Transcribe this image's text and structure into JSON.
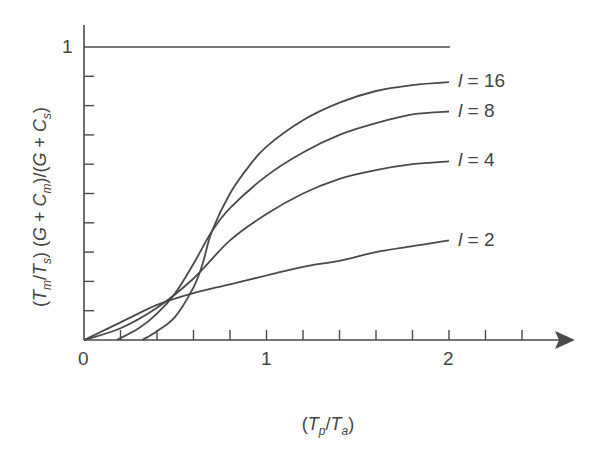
{
  "chart_data": {
    "type": "line",
    "title": "",
    "xlabel": "(Tp/Ta)",
    "ylabel": "(Tm/Ts)(G+Cm)/(G+Cs)",
    "xlim": [
      0,
      2.5
    ],
    "ylim": [
      0,
      1
    ],
    "x_ticks": [
      0,
      0.2,
      0.4,
      0.6,
      0.8,
      1.0,
      1.2,
      1.4,
      1.6,
      1.8,
      2.0,
      2.2,
      2.4
    ],
    "x_tick_labels": [
      "0",
      "1",
      "2"
    ],
    "y_ticks": [
      0.1,
      0.2,
      0.3,
      0.4,
      0.5,
      0.6,
      0.7,
      0.8,
      0.9,
      1.0
    ],
    "y_tick_labels": [
      "1"
    ],
    "grid": false,
    "reference_line": {
      "y": 1,
      "x_range": [
        0,
        2
      ]
    },
    "series": [
      {
        "name": "l = 2",
        "x": [
          0,
          0.2,
          0.4,
          0.6,
          0.8,
          1.0,
          1.2,
          1.4,
          1.6,
          1.8,
          2.0
        ],
        "values": [
          0,
          0.06,
          0.12,
          0.16,
          0.19,
          0.22,
          0.25,
          0.27,
          0.3,
          0.32,
          0.34
        ]
      },
      {
        "name": "l = 4",
        "x": [
          0,
          0.2,
          0.4,
          0.6,
          0.8,
          1.0,
          1.2,
          1.4,
          1.6,
          1.8,
          2.0
        ],
        "values": [
          0,
          0.04,
          0.11,
          0.21,
          0.34,
          0.43,
          0.5,
          0.55,
          0.58,
          0.6,
          0.61
        ]
      },
      {
        "name": "l = 8",
        "x": [
          0.18,
          0.3,
          0.4,
          0.5,
          0.6,
          0.7,
          0.8,
          1.0,
          1.2,
          1.4,
          1.6,
          1.8,
          2.0
        ],
        "values": [
          0,
          0.04,
          0.09,
          0.16,
          0.26,
          0.37,
          0.45,
          0.56,
          0.64,
          0.7,
          0.74,
          0.77,
          0.78
        ]
      },
      {
        "name": "l = 16",
        "x": [
          0.32,
          0.4,
          0.5,
          0.6,
          0.65,
          0.7,
          0.8,
          0.9,
          1.0,
          1.2,
          1.4,
          1.6,
          1.8,
          2.0
        ],
        "values": [
          0,
          0.03,
          0.08,
          0.18,
          0.26,
          0.37,
          0.5,
          0.59,
          0.66,
          0.75,
          0.81,
          0.85,
          0.87,
          0.88
        ]
      }
    ],
    "legend": "inline labels at right end of each curve"
  },
  "labels": {
    "y_one": "1",
    "x_zero": "0",
    "x_one": "1",
    "x_two": "2",
    "l16": "l = 16",
    "l8": "l = 8",
    "l4": "l = 4",
    "l2": "l = 2"
  },
  "colors": {
    "ink": "#4a4a4a",
    "background": "#ffffff"
  }
}
